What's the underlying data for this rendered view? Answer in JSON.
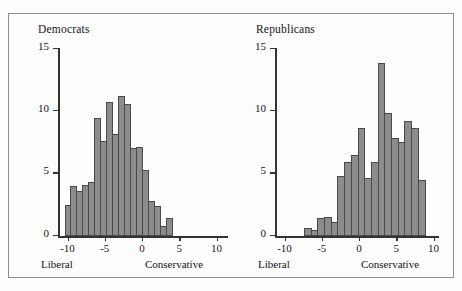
{
  "figure": {
    "background_color": "#fdfdfc",
    "frame_color": "#8e8e8e",
    "bar_fill_color": "#8c8c8c",
    "bar_edge_color": "#4a4a4a",
    "axis_color": "#333333"
  },
  "panels": [
    {
      "key": "democrats",
      "title": "Democrats",
      "left_end_label": "Liberal",
      "right_end_label": "Conservative",
      "ylabel": "",
      "xlabel": ""
    },
    {
      "key": "republicans",
      "title": "Republicans",
      "left_end_label": "Liberal",
      "right_end_label": "Conservative",
      "ylabel": "",
      "xlabel": ""
    }
  ],
  "axes": {
    "yticks": [
      0,
      5,
      10,
      15
    ],
    "ytick_labels": [
      "0",
      "5",
      "10",
      "15"
    ],
    "xticks": [
      -10,
      -5,
      0,
      5,
      10
    ],
    "xtick_labels": [
      "-10",
      "-5",
      "0",
      "5",
      "10"
    ],
    "ylim": [
      0,
      15
    ],
    "xlim": [
      -11,
      11
    ]
  },
  "chart_data": [
    {
      "type": "bar",
      "title": "Democrats",
      "xlabel": "Liberal — Conservative",
      "ylabel": "",
      "xlim": [
        -11,
        11
      ],
      "ylim": [
        0,
        15
      ],
      "grid": false,
      "legend": "none",
      "bin_width": 0.8,
      "bin_left_edges": [
        -10.4,
        -9.6,
        -8.8,
        -8.0,
        -7.2,
        -6.4,
        -5.6,
        -4.8,
        -4.0,
        -3.2,
        -2.4,
        -1.6,
        -0.8,
        0.0,
        0.8,
        1.6,
        2.4,
        3.2,
        4.0,
        4.8,
        5.6,
        6.4
      ],
      "categories": [
        "-10.4",
        "-9.6",
        "-8.8",
        "-8.0",
        "-7.2",
        "-6.4",
        "-5.6",
        "-4.8",
        "-4.0",
        "-3.2",
        "-2.4",
        "-1.6",
        "-0.8",
        "0.0",
        "0.8",
        "1.6",
        "2.4",
        "3.2",
        "4.0",
        "4.8",
        "5.6",
        "6.4"
      ],
      "values": [
        2.5,
        4.0,
        3.6,
        4.1,
        4.3,
        9.4,
        7.6,
        10.7,
        8.1,
        11.2,
        10.5,
        7.0,
        7.1,
        5.3,
        2.8,
        2.4,
        0.8,
        1.4
      ],
      "annotations": [
        "Liberal",
        "Conservative"
      ]
    },
    {
      "type": "bar",
      "title": "Republicans",
      "xlabel": "Liberal — Conservative",
      "ylabel": "",
      "xlim": [
        -11,
        11
      ],
      "ylim": [
        0,
        15
      ],
      "grid": false,
      "legend": "none",
      "bin_width": 0.9,
      "bin_left_edges": [
        -7.4,
        -6.5,
        -5.6,
        -4.7,
        -3.8,
        -2.9,
        -2.0,
        -1.1,
        -0.2,
        0.7,
        1.6,
        2.5,
        3.4,
        4.3,
        5.2,
        6.1,
        7.0,
        7.9,
        8.8,
        9.7
      ],
      "categories": [
        "-7.4",
        "-6.5",
        "-5.6",
        "-4.7",
        "-3.8",
        "-2.9",
        "-2.0",
        "-1.1",
        "-0.2",
        "0.7",
        "1.6",
        "2.5",
        "3.4",
        "4.3",
        "5.2",
        "6.1",
        "7.0",
        "7.9",
        "8.8",
        "9.7"
      ],
      "values": [
        0.6,
        0.5,
        1.4,
        1.5,
        1.1,
        4.8,
        5.9,
        6.5,
        8.6,
        4.6,
        5.9,
        13.8,
        9.8,
        7.8,
        7.5,
        9.2,
        8.6,
        4.5
      ],
      "annotations": [
        "Liberal",
        "Conservative"
      ]
    }
  ]
}
